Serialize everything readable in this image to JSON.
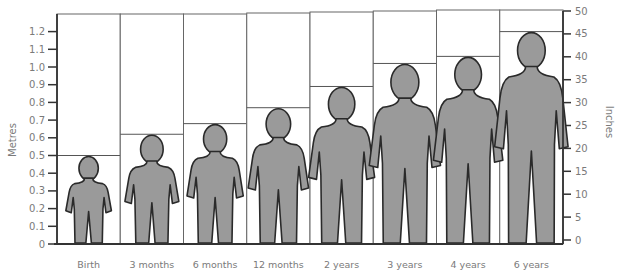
{
  "chart_data": {
    "type": "bar",
    "title": "",
    "categories": [
      "Birth",
      "3 months",
      "6 months",
      "12 months",
      "2 years",
      "3 years",
      "4 years",
      "6 years"
    ],
    "series": [
      {
        "name": "Height (metres)",
        "values": [
          0.5,
          0.62,
          0.68,
          0.77,
          0.89,
          1.02,
          1.06,
          1.2
        ]
      }
    ],
    "xlabel": "",
    "ylabel": "Metres",
    "ylabel_right": "Inches",
    "ylim": [
      0,
      1.3
    ],
    "ylim_right": [
      0,
      50
    ],
    "yticks_left": [
      "0",
      "0.1",
      "0.2",
      "0.3",
      "0.4",
      "0.5",
      "0.6",
      "0.7",
      "0.8",
      "0.9",
      "1.0",
      "1.1",
      "1.2"
    ],
    "yticks_right": [
      "0",
      "5",
      "10",
      "15",
      "20",
      "25",
      "30",
      "35",
      "40",
      "45",
      "50"
    ],
    "grid": false,
    "legend": "none",
    "colors": {
      "figure_fill": "#9a9a9a",
      "figure_outline": "#2a2a2a",
      "frame": "#555555",
      "text": "#7a7a7a"
    }
  }
}
